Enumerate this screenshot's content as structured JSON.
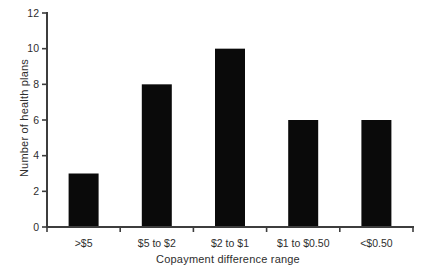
{
  "chart_data": {
    "type": "bar",
    "title": "",
    "categories": [
      ">$5",
      "$5 to $2",
      "$2 to $1",
      "$1 to $0.50",
      "<$0.50"
    ],
    "values": [
      3,
      8,
      10,
      6,
      6
    ],
    "xlabel": "Copayment difference range",
    "ylabel": "Number of health plans",
    "ylim": [
      0,
      12
    ],
    "yticks": [
      0,
      2,
      4,
      6,
      8,
      10,
      12
    ],
    "grid": false,
    "legend_position": "none",
    "bar_color": "#0a0a0a",
    "axis_color": "#3d3d3d",
    "text_color": "#2e2e2e",
    "background": "#ffffff"
  }
}
